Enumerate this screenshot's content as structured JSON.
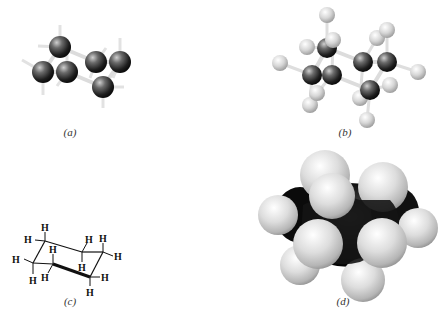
{
  "figure": {
    "panels": [
      {
        "id": "a",
        "label": "(a)",
        "representation": "ball-and-stick (carbons only, H as stubs)"
      },
      {
        "id": "b",
        "label": "(b)",
        "representation": "ball-and-stick with hydrogens"
      },
      {
        "id": "c",
        "label": "(c)",
        "representation": "line structure with H labels"
      },
      {
        "id": "d",
        "label": "(d)",
        "representation": "space-filling model"
      }
    ],
    "atom_label": "H",
    "colors": {
      "carbon": "#2a2a2a",
      "hydrogen": "#d9d9d9",
      "bond": "#e6e6e6",
      "line": "#111111",
      "background": "#ffffff"
    }
  }
}
